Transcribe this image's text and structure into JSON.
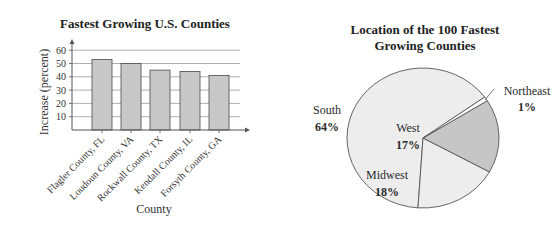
{
  "chart_data": [
    {
      "type": "bar",
      "title": "Fastest Growing U.S. Counties",
      "xlabel": "County",
      "ylabel": "Increase (percent)",
      "categories": [
        "Flagler County, FL",
        "Loudoun County, VA",
        "Rockwall County, TX",
        "Kendall County, IL",
        "Forsyth County, GA"
      ],
      "values": [
        53,
        50,
        45,
        44,
        41
      ],
      "ylim": [
        0,
        60
      ],
      "yticks": [
        10,
        20,
        30,
        40,
        50,
        60
      ],
      "grid": true,
      "colors": {
        "bar": "#c8c8c8",
        "bar_edge": "#4a4a4a",
        "grid": "#9a9a9a"
      }
    },
    {
      "type": "pie",
      "title": "Location of the 100 Fastest Growing Counties",
      "title_lines": [
        "Location of the 100 Fastest",
        "Growing Counties"
      ],
      "labels": [
        "South",
        "Midwest",
        "West",
        "Northeast"
      ],
      "values": [
        64,
        18,
        17,
        1
      ],
      "value_labels": [
        "64%",
        "18%",
        "17%",
        "1%"
      ],
      "colors": {
        "South": "#ededed",
        "Midwest": "#ededed",
        "West": "#c6c6c6",
        "Northeast": "#ffffff",
        "edge": "#555555"
      }
    }
  ]
}
